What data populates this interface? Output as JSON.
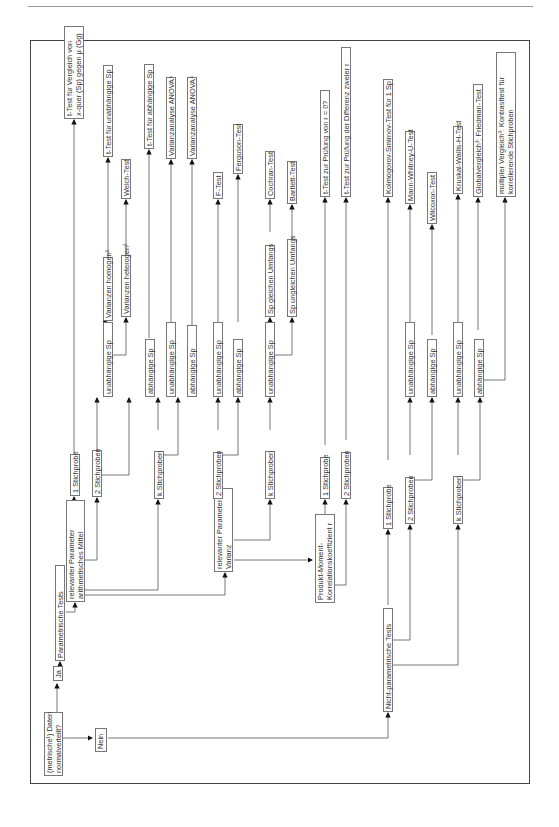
{
  "diagram": {
    "nodes": {
      "root": "(metrische¹) Daten\nnormalverteilt?",
      "ja": "Ja",
      "nein": "Nein",
      "param": "Parametrische Tests",
      "nonparam": "Nicht-parametrische Tests",
      "mean": "relevanter Parameter\narithmetisches Mittel",
      "var": "relevanter Parameter\nVarianz",
      "corr": "Produkt-Moment-\nKorrelationskoeffizient r",
      "m_1sp": "1 Stichprobe",
      "m_2sp": "2 Stichproben",
      "m_ksp": "k Stichproben",
      "m_2_unabh": "unabhängige Sp",
      "m_2_abh": "abhängige Sp",
      "m_k_unabh": "unabhängige Sp",
      "m_k_abh": "abhängige Sp",
      "var_hom": "Varianzen homogen²",
      "var_het": "Varianzen heterogen²",
      "t_1sp": "t-Test für Vergleich von\nx-quer (Sp) gegen μ (Gg)",
      "t_unabh": "t-Test für unabhängige Sp",
      "welch": "Welch-Test",
      "t_abh": "t-Test für abhängige Sp",
      "anova1": "Varianzanalyse ANOVA⁴",
      "anova2": "Varianzanalyse ANOVA⁴",
      "v_2sp": "2 Stichproben",
      "v_ksp": "k Stichproben",
      "v_2_unabh": "unabhängige Sp",
      "v_2_abh": "abhängige Sp",
      "v_k_unabh": "unabhängige Sp",
      "v_gleich": "Sp gleichen Umfangs",
      "v_ungleich": "Sp ungleichen Umfangs",
      "ftest": "F-Test",
      "ferguson": "Ferguson-Test",
      "cochran": "Cochran-Test",
      "bartlett": "Bartlett-Test",
      "c_1sp": "1 Stichprobe",
      "c_2sp": "2 Stichproben",
      "t_r0": "t-Test zur Prüfung von r = 0?",
      "t_rdiff": "t-Test zur Prüfung der Differenz zweier r",
      "n_1sp": "1 Stichprobe",
      "n_2sp": "2 Stichproben",
      "n_ksp": "k Stichproben",
      "n_2_unabh": "unabhängige Sp",
      "n_2_abh": "abhängige Sp",
      "n_k_unabh": "unabhängige Sp",
      "n_k_abh": "abhängige Sp",
      "ks": "Kolmogorov-Smirnov-Test für 1 Sp",
      "mwu": "Mann-Whitney-U-Test",
      "wilcoxon": "Wilcoxon-Test",
      "kw": "Kruskal-Wallis-H-Test",
      "friedman": "Globalvergleich³: Friedman-Test",
      "multiple": "multipler Vergleich³: Kontrasttest für\nkorrelierende Stichproben"
    }
  }
}
